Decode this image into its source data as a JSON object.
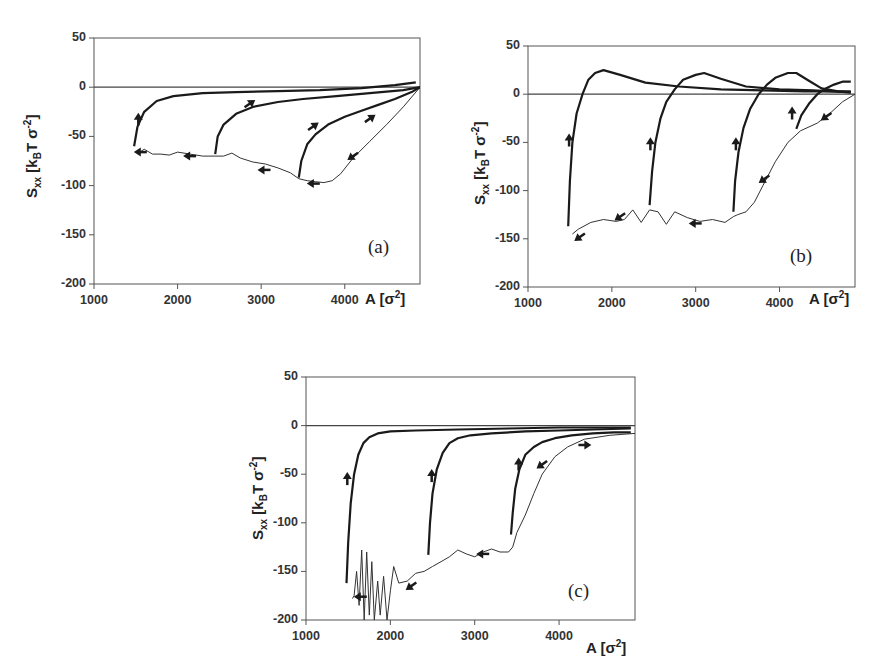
{
  "chart_data": [
    {
      "id": "a",
      "type": "line",
      "panel_label": "(a)",
      "xlabel": "A [σ²]",
      "ylabel": "Sxx [kBT σ⁻²]",
      "xlim": [
        1000,
        4900
      ],
      "ylim": [
        -200,
        50
      ],
      "xticks": [
        "1000",
        "2000",
        "3000",
        "4000"
      ],
      "yticks": [
        "50",
        "0",
        "-50",
        "-100",
        "-150",
        "-200"
      ],
      "zero_line": true,
      "series": [
        {
          "name": "compression (thin, noisy)",
          "style": "thin",
          "x": [
            4900,
            4700,
            4500,
            4300,
            4100,
            3950,
            3850,
            3750,
            3650,
            3550,
            3450,
            3350,
            3200,
            3050,
            2900,
            2750,
            2650,
            2550,
            2450,
            2300,
            2150,
            2000,
            1900,
            1800,
            1700,
            1600,
            1550
          ],
          "y": [
            0,
            -20,
            -38,
            -55,
            -72,
            -88,
            -95,
            -97,
            -96,
            -95,
            -93,
            -87,
            -82,
            -78,
            -76,
            -72,
            -67,
            -70,
            -70,
            -70,
            -68,
            -66,
            -69,
            -68,
            -68,
            -63,
            -66
          ]
        },
        {
          "name": "expansion from 3450",
          "style": "thick",
          "x": [
            3450,
            3480,
            3550,
            3650,
            3800,
            4000,
            4200,
            4400,
            4600,
            4800,
            4900
          ],
          "y": [
            -92,
            -75,
            -58,
            -48,
            -38,
            -30,
            -24,
            -18,
            -12,
            -5,
            0
          ]
        },
        {
          "name": "expansion from 2450",
          "style": "thick",
          "x": [
            2450,
            2480,
            2550,
            2700,
            2900,
            3200,
            3500,
            3900,
            4300,
            4700,
            4900
          ],
          "y": [
            -68,
            -50,
            -38,
            -27,
            -20,
            -15,
            -12,
            -9,
            -6,
            -3,
            0
          ]
        },
        {
          "name": "expansion from 1480",
          "style": "thick",
          "x": [
            1480,
            1520,
            1600,
            1750,
            1950,
            2300,
            2700,
            3200,
            3700,
            4200,
            4600,
            4850
          ],
          "y": [
            -60,
            -40,
            -25,
            -14,
            -9,
            -6,
            -5,
            -4,
            -3,
            -1,
            2,
            5
          ]
        }
      ],
      "arrows": [
        {
          "x": 1530,
          "y": -33,
          "dir": "up"
        },
        {
          "x": 1560,
          "y": -66,
          "dir": "left"
        },
        {
          "x": 2150,
          "y": -70,
          "dir": "left"
        },
        {
          "x": 2860,
          "y": -17,
          "dir": "right-up"
        },
        {
          "x": 3040,
          "y": -84,
          "dir": "left"
        },
        {
          "x": 3620,
          "y": -40,
          "dir": "right-up"
        },
        {
          "x": 3630,
          "y": -98,
          "dir": "left"
        },
        {
          "x": 4300,
          "y": -32,
          "dir": "right-up"
        },
        {
          "x": 4100,
          "y": -70,
          "dir": "left-down"
        }
      ]
    },
    {
      "id": "b",
      "type": "line",
      "panel_label": "(b)",
      "xlabel": "A [σ²]",
      "ylabel": "Sxx [kBT σ⁻²]",
      "xlim": [
        1000,
        4900
      ],
      "ylim": [
        -200,
        50
      ],
      "xticks": [
        "1000",
        "2000",
        "3000",
        "4000"
      ],
      "yticks": [
        "50",
        "0",
        "-50",
        "-100",
        "-150",
        "-200"
      ],
      "zero_line": true,
      "series": [
        {
          "name": "compression (thin, noisy)",
          "style": "thin",
          "x": [
            4900,
            4750,
            4600,
            4450,
            4250,
            4100,
            3950,
            3800,
            3700,
            3600,
            3500,
            3450,
            3350,
            3200,
            3050,
            2900,
            2750,
            2650,
            2550,
            2450,
            2350,
            2250,
            2150,
            2050,
            1900,
            1750,
            1600,
            1530
          ],
          "y": [
            0,
            -8,
            -20,
            -30,
            -38,
            -50,
            -70,
            -95,
            -112,
            -122,
            -125,
            -127,
            -133,
            -130,
            -132,
            -128,
            -122,
            -135,
            -122,
            -120,
            -133,
            -120,
            -130,
            -132,
            -130,
            -133,
            -140,
            -145
          ]
        },
        {
          "name": "expansion from 1480",
          "style": "thick",
          "x": [
            1480,
            1500,
            1530,
            1580,
            1650,
            1720,
            1800,
            1900,
            2100,
            2400,
            2800,
            3300,
            3800,
            4300,
            4850
          ],
          "y": [
            -137,
            -90,
            -50,
            -20,
            0,
            15,
            22,
            25,
            20,
            12,
            8,
            5,
            4,
            3,
            3
          ]
        },
        {
          "name": "expansion from 2450",
          "style": "thick",
          "x": [
            2450,
            2480,
            2520,
            2580,
            2650,
            2750,
            2850,
            3000,
            3100,
            3300,
            3600,
            4000,
            4400,
            4850
          ],
          "y": [
            -115,
            -80,
            -50,
            -25,
            -8,
            5,
            15,
            20,
            22,
            16,
            8,
            5,
            4,
            2
          ]
        },
        {
          "name": "expansion from 3450",
          "style": "thick",
          "x": [
            3450,
            3470,
            3510,
            3570,
            3650,
            3750,
            3850,
            3950,
            4100,
            4200,
            4350,
            4500,
            4700,
            4850
          ],
          "y": [
            -122,
            -90,
            -60,
            -35,
            -15,
            0,
            10,
            17,
            22,
            22,
            14,
            6,
            3,
            2
          ]
        },
        {
          "name": "expansion from 4200",
          "style": "thick",
          "x": [
            4200,
            4260,
            4350,
            4450,
            4550,
            4650,
            4750,
            4850
          ],
          "y": [
            -36,
            -22,
            -10,
            0,
            6,
            10,
            13,
            13
          ]
        }
      ],
      "arrows": [
        {
          "x": 1490,
          "y": -48,
          "dir": "up"
        },
        {
          "x": 1620,
          "y": -148,
          "dir": "left-down"
        },
        {
          "x": 2100,
          "y": -127,
          "dir": "left-down"
        },
        {
          "x": 2460,
          "y": -52,
          "dir": "up"
        },
        {
          "x": 3000,
          "y": -134,
          "dir": "left"
        },
        {
          "x": 3480,
          "y": -52,
          "dir": "up"
        },
        {
          "x": 3820,
          "y": -88,
          "dir": "left-down"
        },
        {
          "x": 4150,
          "y": -20,
          "dir": "up"
        },
        {
          "x": 4560,
          "y": -23,
          "dir": "left-down"
        }
      ]
    },
    {
      "id": "c",
      "type": "line",
      "panel_label": "(c)",
      "xlabel": "A [σ²]",
      "ylabel": "Sxx [kBT σ⁻²]",
      "xlim": [
        1000,
        4900
      ],
      "ylim": [
        -200,
        50
      ],
      "xticks": [
        "1000",
        "2000",
        "3000",
        "4000"
      ],
      "yticks": [
        "50",
        "0",
        "-50",
        "-100",
        "-150",
        "-200"
      ],
      "zero_line": true,
      "series": [
        {
          "name": "compression (thin, noisy)",
          "style": "thin",
          "x": [
            4900,
            4600,
            4300,
            4100,
            3950,
            3800,
            3700,
            3600,
            3500,
            3450,
            3400,
            3300,
            3200,
            3100,
            3000,
            2900,
            2800,
            2700,
            2600,
            2500,
            2400,
            2300,
            2200,
            2100,
            2040,
            2000,
            1960,
            1920,
            1880,
            1850,
            1810,
            1780,
            1750,
            1720,
            1690,
            1660,
            1630,
            1600,
            1570,
            1550
          ],
          "y": [
            -8,
            -10,
            -14,
            -22,
            -32,
            -50,
            -70,
            -92,
            -110,
            -125,
            -130,
            -130,
            -127,
            -130,
            -135,
            -132,
            -128,
            -135,
            -140,
            -145,
            -150,
            -152,
            -160,
            -162,
            -145,
            -170,
            -200,
            -155,
            -195,
            -160,
            -200,
            -140,
            -195,
            -130,
            -200,
            -128,
            -185,
            -150,
            -175,
            -178
          ]
        },
        {
          "name": "expansion from 1480",
          "style": "thick",
          "x": [
            1480,
            1500,
            1530,
            1570,
            1620,
            1680,
            1750,
            1850,
            2000,
            2300,
            2800,
            3400,
            4000,
            4600,
            4850
          ],
          "y": [
            -162,
            -120,
            -80,
            -50,
            -30,
            -18,
            -12,
            -8,
            -6,
            -5,
            -4,
            -3,
            -2,
            -2,
            -2
          ]
        },
        {
          "name": "expansion from 2450",
          "style": "thick",
          "x": [
            2450,
            2470,
            2500,
            2550,
            2620,
            2700,
            2800,
            2950,
            3200,
            3600,
            4000,
            4400,
            4850
          ],
          "y": [
            -133,
            -100,
            -70,
            -45,
            -28,
            -18,
            -13,
            -10,
            -8,
            -6,
            -5,
            -4,
            -3
          ]
        },
        {
          "name": "expansion from 3430",
          "style": "thick",
          "x": [
            3430,
            3450,
            3480,
            3530,
            3600,
            3700,
            3800,
            3950,
            4150,
            4400,
            4650,
            4850
          ],
          "y": [
            -112,
            -90,
            -65,
            -45,
            -30,
            -22,
            -17,
            -13,
            -10,
            -8,
            -7,
            -7
          ]
        }
      ],
      "arrows": [
        {
          "x": 1490,
          "y": -55,
          "dir": "up"
        },
        {
          "x": 1650,
          "y": -176,
          "dir": "left"
        },
        {
          "x": 2250,
          "y": -165,
          "dir": "left-down"
        },
        {
          "x": 2490,
          "y": -52,
          "dir": "up"
        },
        {
          "x": 3100,
          "y": -132,
          "dir": "left"
        },
        {
          "x": 3520,
          "y": -40,
          "dir": "up"
        },
        {
          "x": 3800,
          "y": -40,
          "dir": "left-down"
        },
        {
          "x": 4300,
          "y": -20,
          "dir": "right"
        }
      ]
    }
  ],
  "panels": {
    "a": {
      "label": "(a)",
      "xlabel_main": "A [σ",
      "xlabel_sup": "2",
      "xlabel_end": "]",
      "ylabel_main": "S",
      "ylabel_sub": "xx",
      "ylabel_mid": " [k",
      "ylabel_sub2": "B",
      "ylabel_mid2": "T σ",
      "ylabel_sup": "-2",
      "ylabel_end": "]"
    },
    "b": {
      "label": "(b)",
      "xlabel_main": "A [σ",
      "xlabel_sup": "2",
      "xlabel_end": "]",
      "ylabel_main": "S",
      "ylabel_sub": "xx",
      "ylabel_mid": " [k",
      "ylabel_sub2": "B",
      "ylabel_mid2": "T σ",
      "ylabel_sup": "-2",
      "ylabel_end": "]"
    },
    "c": {
      "label": "(c)",
      "xlabel_main": "A [σ",
      "xlabel_sup": "2",
      "xlabel_end": "]",
      "ylabel_main": "S",
      "ylabel_sub": "xx",
      "ylabel_mid": " [k",
      "ylabel_sub2": "B",
      "ylabel_mid2": "T σ",
      "ylabel_sup": "-2",
      "ylabel_end": "]"
    }
  },
  "colors": {
    "axis": "#555555",
    "curve": "#1a1a1a",
    "thin_curve": "#333333",
    "zero_line": "#444444"
  }
}
